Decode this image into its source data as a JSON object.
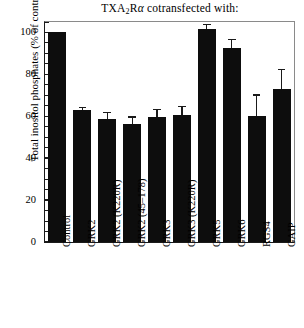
{
  "chart_data": {
    "type": "bar",
    "title": "TXA2Rα cotransfected with:",
    "title_parts": {
      "pre": "TXA",
      "sub": "2",
      "mid": "R",
      "alpha": "α",
      "post": " cotransfected with:"
    },
    "xlabel": "",
    "ylabel": "Total inositol phosphates (% of control)",
    "ylim": [
      0,
      105
    ],
    "yticks": [
      0,
      20,
      40,
      60,
      80,
      100
    ],
    "ytick_labels": [
      "0",
      "20",
      "40",
      "60",
      "80",
      "100"
    ],
    "y_minor_interval": 5,
    "grid": false,
    "legend": "none",
    "bar_color": "#0d0d0d",
    "categories": [
      "Control",
      "GRK2",
      "GRK2 (K220R)",
      "GRK2 (45–178)",
      "GRK3",
      "GRK3 (K220R)",
      "GRK5",
      "GRK6",
      "RGS4",
      "GAIP"
    ],
    "values": [
      100,
      63,
      58.5,
      56.5,
      59.5,
      60.5,
      101.5,
      92.5,
      60,
      73
    ],
    "errors": [
      0,
      1.5,
      3.5,
      3.5,
      4,
      4.5,
      2.5,
      4.5,
      10.5,
      9.5
    ]
  }
}
